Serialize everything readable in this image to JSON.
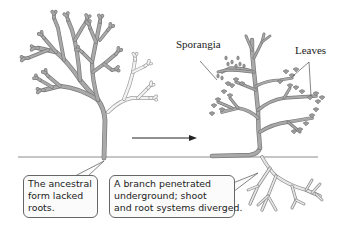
{
  "diagram": {
    "labels": {
      "sporangia": "Sporangia",
      "leaves": "Leaves"
    },
    "callouts": {
      "ancestral": {
        "lines": [
          "The ancestral",
          "form lacked",
          "roots."
        ]
      },
      "derived": {
        "lines": [
          "A branch penetrated",
          "underground; shoot",
          "and root systems diverged."
        ]
      }
    },
    "colors": {
      "stem_fill": "#a9a9a9",
      "stem_outline": "#7a7a7a",
      "faded_branch_fill": "#f2f2f2",
      "faded_branch_outline": "#a0a0a0",
      "root_fill": "#e6e6e6",
      "root_outline": "#8a8a8a",
      "leaf_fill": "#9a9a9a",
      "ground_line": "#8c8c8c",
      "arrow": "#222222",
      "text": "#222222"
    }
  }
}
